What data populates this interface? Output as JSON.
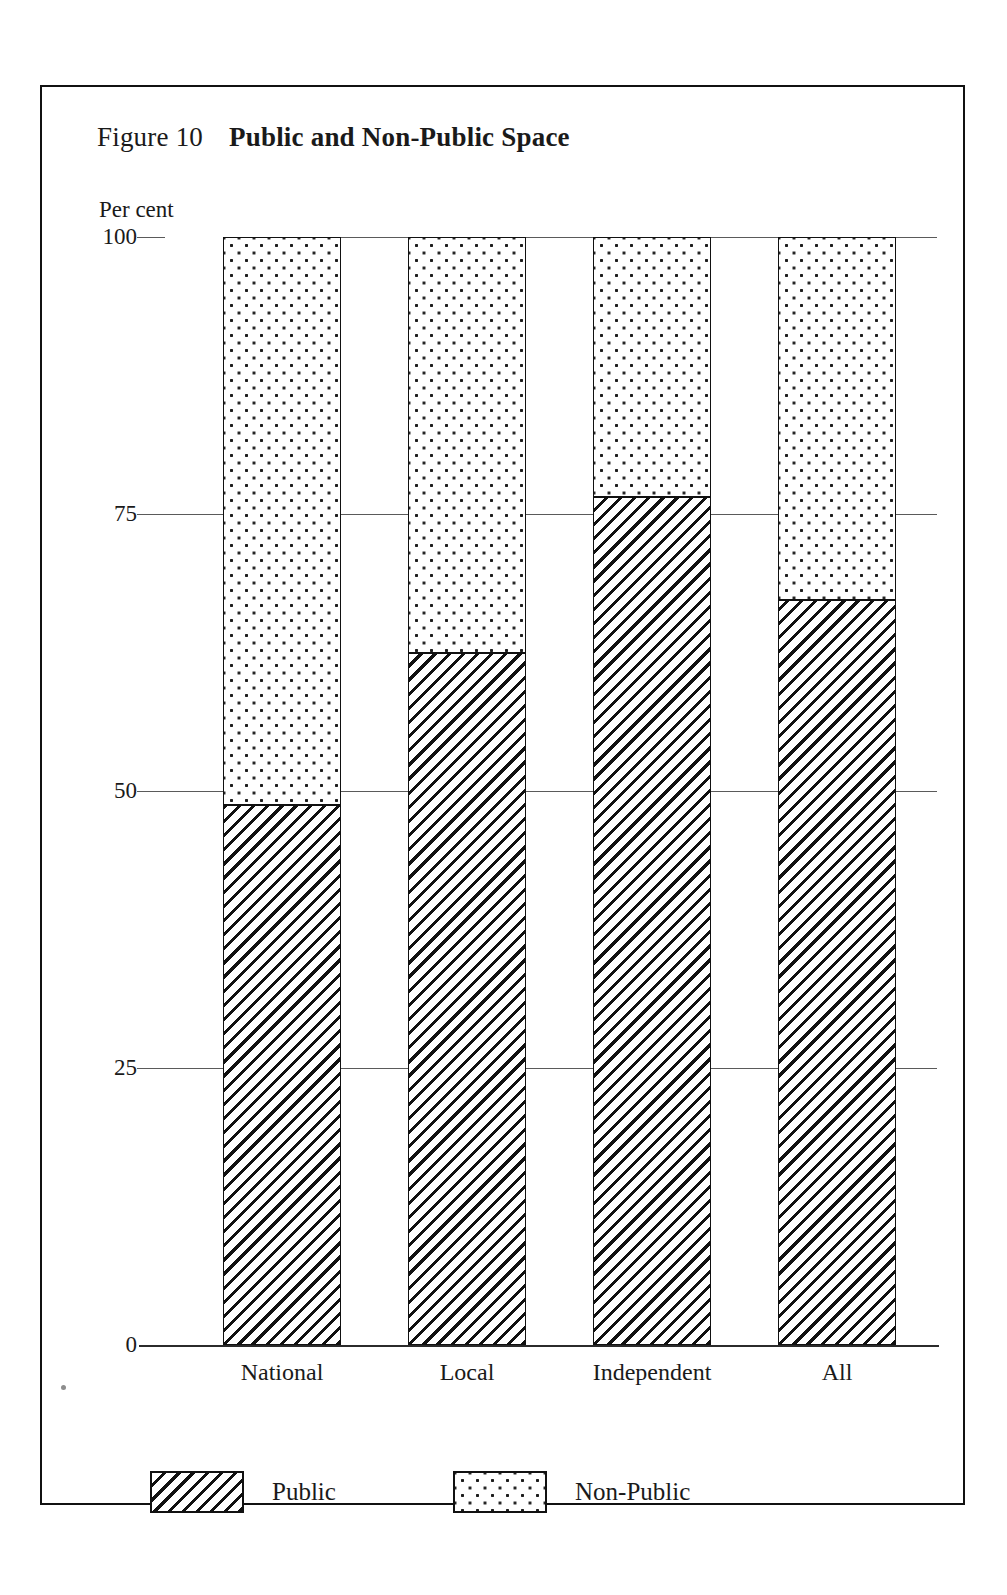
{
  "figure": {
    "label": "Figure 10",
    "title": "Public and Non-Public Space",
    "axis_unit": "Per cent"
  },
  "chart_data": {
    "type": "bar",
    "subtype": "stacked-percentage",
    "title": "Public and Non-Public Space",
    "figure_label": "Figure 10",
    "xlabel": "",
    "ylabel": "Per cent",
    "ylim": [
      0,
      100
    ],
    "yticks": [
      0,
      25,
      50,
      75,
      100
    ],
    "ytick_labels": [
      "0",
      "25",
      "50",
      "75",
      "100"
    ],
    "grid": true,
    "grid_axis": "y",
    "legend_position": "bottom-left",
    "categories": [
      "National",
      "Local",
      "Independent",
      "All"
    ],
    "series": [
      {
        "name": "Public",
        "pattern": "diagonal-hatch",
        "values": [
          48.7,
          62.5,
          76.5,
          67.2
        ]
      },
      {
        "name": "Non-Public",
        "pattern": "dotted",
        "values": [
          51.3,
          37.5,
          23.5,
          32.8
        ]
      }
    ]
  },
  "legend": {
    "items": [
      {
        "label": "Public",
        "pattern": "diagonal-hatch"
      },
      {
        "label": "Non-Public",
        "pattern": "dotted"
      }
    ]
  },
  "colors": {
    "ink": "#111111",
    "grid": "#5a5a5a",
    "paper": "#ffffff"
  }
}
